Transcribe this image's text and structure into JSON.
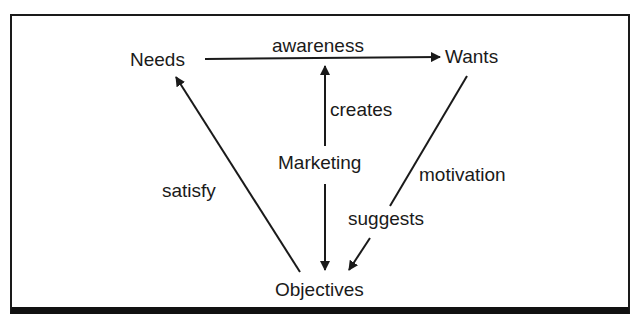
{
  "diagram": {
    "nodes": {
      "needs": "Needs",
      "wants": "Wants",
      "marketing": "Marketing",
      "objectives": "Objectives"
    },
    "edges": {
      "awareness": "awareness",
      "creates": "creates",
      "satisfy": "satisfy",
      "motivation": "motivation",
      "suggests": "suggests"
    },
    "relations": [
      {
        "from": "Needs",
        "to": "Wants",
        "label": "awareness"
      },
      {
        "from": "Marketing",
        "to": "awareness",
        "label": "creates"
      },
      {
        "from": "Marketing",
        "to": "Objectives",
        "label": ""
      },
      {
        "from": "Wants",
        "to": "Objectives",
        "label": "motivation / suggests"
      },
      {
        "from": "Objectives",
        "to": "Needs",
        "label": "satisfy"
      }
    ],
    "colors": {
      "ink": "#1a1a1a",
      "background": "#ffffff"
    }
  }
}
